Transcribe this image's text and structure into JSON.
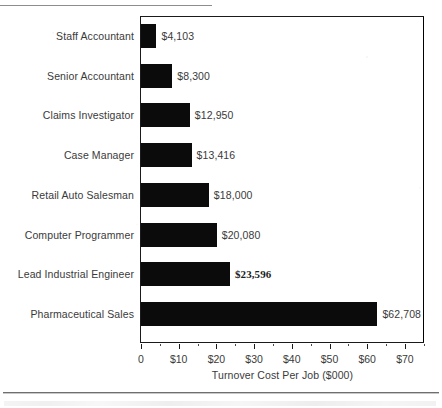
{
  "chart_data": {
    "type": "bar",
    "orientation": "horizontal",
    "title": "",
    "xlabel": "Turnover Cost Per Job ($000)",
    "ylabel": "",
    "xlim": [
      0,
      75
    ],
    "xtick_values": [
      0,
      10,
      20,
      30,
      40,
      50,
      60,
      70
    ],
    "xtick_labels": [
      "0",
      "$10",
      "$20",
      "$30",
      "$40",
      "$50",
      "$60",
      "$70"
    ],
    "minor_tick_interval": 5,
    "grid": false,
    "legend": false,
    "units": "dollars",
    "bar_color": "#0b0b0b",
    "categories": [
      "Staff Accountant",
      "Senior Accountant",
      "Claims Investigator",
      "Case Manager",
      "Retail Auto Salesman",
      "Computer Programmer",
      "Lead Industrial Engineer",
      "Pharmaceutical Sales"
    ],
    "values": [
      4103,
      8300,
      12950,
      13416,
      18000,
      20080,
      23596,
      62708
    ],
    "value_labels": [
      "$4,103",
      "$8,300",
      "$12,950",
      "$13,416",
      "$18,000",
      "$20,080",
      "$23,596",
      "$62,708"
    ],
    "value_label_styles": [
      "sans",
      "sans",
      "sans",
      "sans",
      "sans",
      "sans",
      "serif-bold",
      "sans"
    ]
  },
  "page": {
    "rule_top": "horizontal-rule",
    "rule_bottom": "horizontal-rule",
    "footer_text": ""
  }
}
